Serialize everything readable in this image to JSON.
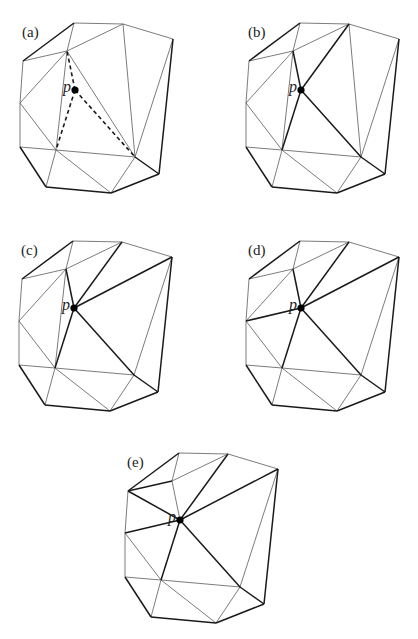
{
  "figure": {
    "vertices": {
      "A": [
        74,
        23
      ],
      "B": [
        123,
        24
      ],
      "C": [
        173,
        39
      ],
      "D": [
        23,
        61
      ],
      "E": [
        67,
        51
      ],
      "F": [
        20,
        103
      ],
      "G": [
        20,
        147
      ],
      "H": [
        56,
        150
      ],
      "I": [
        135,
        157
      ],
      "J": [
        159,
        174
      ],
      "K": [
        46,
        187
      ],
      "L": [
        111,
        193
      ],
      "p": [
        75,
        90
      ]
    },
    "point_label": "p",
    "panels": [
      {
        "label": "(a)",
        "offset": [
          0,
          0
        ],
        "thick": [
          [
            "D",
            "A"
          ],
          [
            "G",
            "K"
          ],
          [
            "K",
            "L"
          ],
          [
            "L",
            "J"
          ],
          [
            "J",
            "C"
          ],
          [
            "I",
            "J"
          ]
        ],
        "thin": [
          [
            "A",
            "B"
          ],
          [
            "B",
            "C"
          ],
          [
            "D",
            "F"
          ],
          [
            "F",
            "G"
          ],
          [
            "A",
            "E"
          ],
          [
            "D",
            "E"
          ],
          [
            "B",
            "E"
          ],
          [
            "E",
            "F"
          ],
          [
            "E",
            "H"
          ],
          [
            "E",
            "I"
          ],
          [
            "B",
            "I"
          ],
          [
            "C",
            "I"
          ],
          [
            "F",
            "H"
          ],
          [
            "G",
            "H"
          ],
          [
            "H",
            "I"
          ],
          [
            "H",
            "K"
          ],
          [
            "H",
            "L"
          ],
          [
            "I",
            "L"
          ]
        ],
        "dashed": [
          [
            "p",
            "E"
          ],
          [
            "p",
            "H"
          ],
          [
            "p",
            "I"
          ]
        ]
      },
      {
        "label": "(b)",
        "offset": [
          226,
          0
        ],
        "thick": [
          [
            "D",
            "A"
          ],
          [
            "G",
            "K"
          ],
          [
            "K",
            "L"
          ],
          [
            "L",
            "J"
          ],
          [
            "J",
            "C"
          ],
          [
            "I",
            "J"
          ],
          [
            "p",
            "E"
          ],
          [
            "p",
            "H"
          ],
          [
            "p",
            "I"
          ],
          [
            "p",
            "B"
          ]
        ],
        "thin": [
          [
            "A",
            "B"
          ],
          [
            "B",
            "C"
          ],
          [
            "D",
            "F"
          ],
          [
            "F",
            "G"
          ],
          [
            "A",
            "E"
          ],
          [
            "D",
            "E"
          ],
          [
            "B",
            "E"
          ],
          [
            "E",
            "F"
          ],
          [
            "E",
            "H"
          ],
          [
            "B",
            "I"
          ],
          [
            "C",
            "I"
          ],
          [
            "F",
            "H"
          ],
          [
            "G",
            "H"
          ],
          [
            "H",
            "I"
          ],
          [
            "H",
            "K"
          ],
          [
            "H",
            "L"
          ],
          [
            "I",
            "L"
          ]
        ],
        "dashed": []
      },
      {
        "label": "(c)",
        "offset": [
          -1,
          218
        ],
        "thick": [
          [
            "D",
            "A"
          ],
          [
            "G",
            "K"
          ],
          [
            "K",
            "L"
          ],
          [
            "L",
            "J"
          ],
          [
            "J",
            "C"
          ],
          [
            "I",
            "J"
          ],
          [
            "p",
            "E"
          ],
          [
            "p",
            "H"
          ],
          [
            "p",
            "I"
          ],
          [
            "p",
            "B"
          ],
          [
            "p",
            "C"
          ]
        ],
        "thin": [
          [
            "A",
            "B"
          ],
          [
            "B",
            "C"
          ],
          [
            "D",
            "F"
          ],
          [
            "F",
            "G"
          ],
          [
            "A",
            "E"
          ],
          [
            "D",
            "E"
          ],
          [
            "B",
            "E"
          ],
          [
            "E",
            "F"
          ],
          [
            "E",
            "H"
          ],
          [
            "C",
            "I"
          ],
          [
            "F",
            "H"
          ],
          [
            "G",
            "H"
          ],
          [
            "H",
            "I"
          ],
          [
            "H",
            "K"
          ],
          [
            "H",
            "L"
          ],
          [
            "I",
            "L"
          ]
        ],
        "dashed": []
      },
      {
        "label": "(d)",
        "offset": [
          226,
          218
        ],
        "thick": [
          [
            "D",
            "A"
          ],
          [
            "G",
            "K"
          ],
          [
            "K",
            "L"
          ],
          [
            "L",
            "J"
          ],
          [
            "J",
            "C"
          ],
          [
            "I",
            "J"
          ],
          [
            "p",
            "E"
          ],
          [
            "p",
            "H"
          ],
          [
            "p",
            "I"
          ],
          [
            "p",
            "B"
          ],
          [
            "p",
            "C"
          ],
          [
            "p",
            "F"
          ]
        ],
        "thin": [
          [
            "A",
            "B"
          ],
          [
            "B",
            "C"
          ],
          [
            "D",
            "F"
          ],
          [
            "F",
            "G"
          ],
          [
            "A",
            "E"
          ],
          [
            "D",
            "E"
          ],
          [
            "B",
            "E"
          ],
          [
            "E",
            "F"
          ],
          [
            "C",
            "I"
          ],
          [
            "F",
            "H"
          ],
          [
            "G",
            "H"
          ],
          [
            "H",
            "I"
          ],
          [
            "H",
            "K"
          ],
          [
            "H",
            "L"
          ],
          [
            "I",
            "L"
          ]
        ],
        "dashed": []
      },
      {
        "label": "(e)",
        "offset": [
          105,
          430
        ],
        "thick": [
          [
            "D",
            "A"
          ],
          [
            "G",
            "K"
          ],
          [
            "K",
            "L"
          ],
          [
            "L",
            "J"
          ],
          [
            "J",
            "C"
          ],
          [
            "I",
            "J"
          ],
          [
            "p",
            "H"
          ],
          [
            "p",
            "I"
          ],
          [
            "p",
            "B"
          ],
          [
            "p",
            "C"
          ],
          [
            "p",
            "F"
          ],
          [
            "p",
            "D"
          ],
          [
            "D",
            "E"
          ]
        ],
        "thin": [
          [
            "A",
            "B"
          ],
          [
            "B",
            "C"
          ],
          [
            "D",
            "F"
          ],
          [
            "F",
            "G"
          ],
          [
            "A",
            "E"
          ],
          [
            "B",
            "E"
          ],
          [
            "p",
            "E"
          ],
          [
            "C",
            "I"
          ],
          [
            "F",
            "H"
          ],
          [
            "G",
            "H"
          ],
          [
            "H",
            "I"
          ],
          [
            "H",
            "K"
          ],
          [
            "H",
            "L"
          ],
          [
            "I",
            "L"
          ]
        ],
        "dashed": []
      }
    ]
  }
}
